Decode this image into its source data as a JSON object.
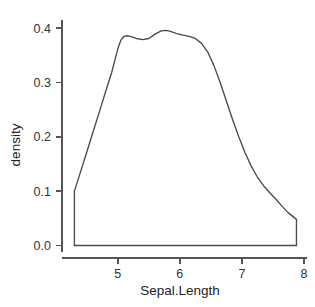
{
  "chart_data": {
    "type": "line",
    "title": "",
    "xlabel": "Sepal.Length",
    "ylabel": "density",
    "xlim": [
      4.1,
      8.05
    ],
    "ylim": [
      -0.012,
      0.415
    ],
    "grid": false,
    "legend": "none",
    "line_color": "#4a4a4a",
    "axis_color": "#555555",
    "background": "#ffffff",
    "xticks": [
      5,
      6,
      7,
      8
    ],
    "xtick_labels": [
      "5",
      "6",
      "7",
      "8"
    ],
    "yticks": [
      0.0,
      0.1,
      0.2,
      0.3,
      0.4
    ],
    "ytick_labels": [
      "0.0",
      "0.1",
      "0.2",
      "0.3",
      "0.4"
    ],
    "series": [
      {
        "name": "density",
        "x": [
          4.3,
          4.3,
          4.4,
          4.5,
          4.6,
          4.7,
          4.8,
          4.9,
          5.0,
          5.05,
          5.1,
          5.15,
          5.2,
          5.3,
          5.4,
          5.5,
          5.6,
          5.7,
          5.78,
          5.85,
          5.95,
          6.05,
          6.15,
          6.25,
          6.35,
          6.45,
          6.55,
          6.65,
          6.75,
          6.85,
          6.95,
          7.05,
          7.15,
          7.25,
          7.35,
          7.45,
          7.55,
          7.65,
          7.75,
          7.88,
          7.88
        ],
        "y": [
          0.0,
          0.1,
          0.136,
          0.172,
          0.209,
          0.245,
          0.282,
          0.318,
          0.362,
          0.378,
          0.385,
          0.386,
          0.385,
          0.381,
          0.379,
          0.381,
          0.389,
          0.395,
          0.396,
          0.394,
          0.39,
          0.387,
          0.385,
          0.381,
          0.372,
          0.356,
          0.331,
          0.3,
          0.266,
          0.232,
          0.2,
          0.171,
          0.146,
          0.126,
          0.11,
          0.097,
          0.085,
          0.072,
          0.06,
          0.048,
          0.0
        ]
      }
    ],
    "baseline": {
      "x_start": 4.3,
      "x_end": 7.88,
      "y": 0.0
    }
  },
  "axes": {
    "x_title": "Sepal.Length",
    "y_title": "density"
  }
}
